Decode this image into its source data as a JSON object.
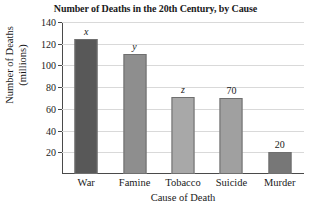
{
  "chart_data": {
    "type": "bar",
    "title": "Number of Deaths in the 20th Century, by Cause",
    "xlabel": "Cause of Death",
    "ylabel_line1": "Number of Deaths",
    "ylabel_line2": "(millions)",
    "categories": [
      "War",
      "Famine",
      "Tobacco",
      "Suicide",
      "Murder"
    ],
    "values": [
      124,
      111,
      71,
      70,
      20
    ],
    "point_labels": [
      "x",
      "y",
      "z",
      "70",
      "20"
    ],
    "label_is_variable": [
      true,
      true,
      true,
      false,
      false
    ],
    "bar_colors": [
      "#585858",
      "#8e8e8e",
      "#a8a8a8",
      "#a0a0a0",
      "#777777"
    ],
    "ylim": [
      0,
      140
    ],
    "ytick_values": [
      20,
      40,
      60,
      80,
      100,
      120,
      140
    ],
    "ytick_labels": [
      "20",
      "40",
      "60",
      "80",
      "100",
      "120",
      "140"
    ],
    "grid": true,
    "legend": "none"
  },
  "style": {
    "grid_color": "#d9d9d9",
    "axis_color": "#4a4a4a",
    "background": "#ffffff"
  }
}
